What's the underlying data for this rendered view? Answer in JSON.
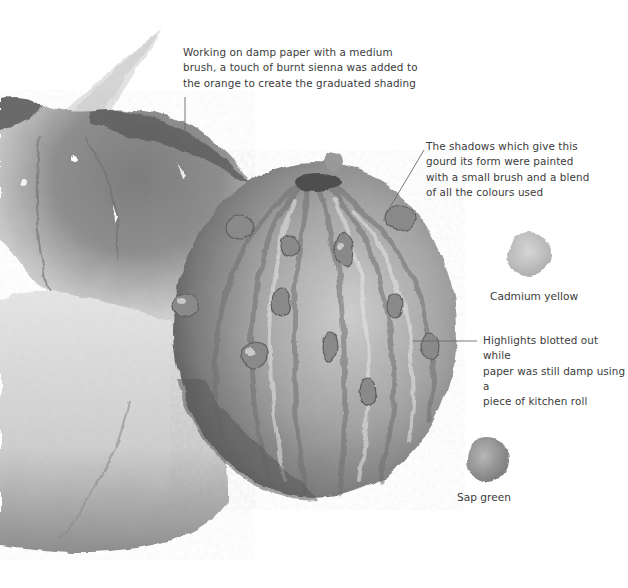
{
  "illustration": {
    "subjects": [
      "pumpkin",
      "warty-gourd"
    ],
    "tone": "greyscale watercolour"
  },
  "annotations": [
    {
      "id": "damp-paper",
      "text": "Working on damp paper with a medium\nbrush, a touch of burnt sienna was added to\nthe orange to create the graduated shading"
    },
    {
      "id": "shadows",
      "text": "The shadows which give this\ngourd its form were painted\nwith a small brush and a blend\nof all the colours used"
    },
    {
      "id": "highlights",
      "text": "Highlights blotted out while\npaper was still damp using a\npiece of kitchen roll"
    }
  ],
  "swatches": [
    {
      "label": "Cadmium yellow",
      "color": "#c9c9c9"
    },
    {
      "label": "Sap green",
      "color": "#9a9a9a"
    }
  ],
  "colors": {
    "text": "#3b3b3b",
    "leader_line": "#6a6a6a",
    "background": "#ffffff"
  }
}
